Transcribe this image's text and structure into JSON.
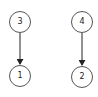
{
  "diagram": {
    "type": "directed-graph",
    "nodes": [
      {
        "id": "n3",
        "label": "3",
        "cx": 20,
        "cy": 22
      },
      {
        "id": "n1",
        "label": "1",
        "cx": 20,
        "cy": 76
      },
      {
        "id": "n4",
        "label": "4",
        "cx": 82,
        "cy": 22
      },
      {
        "id": "n2",
        "label": "2",
        "cx": 82,
        "cy": 77
      }
    ],
    "edges": [
      {
        "from": "3",
        "to": "1"
      },
      {
        "from": "4",
        "to": "2"
      }
    ],
    "colors": {
      "background": "#ffffff",
      "stroke": "#555555",
      "edge": "#222222",
      "text": "#222222"
    }
  }
}
